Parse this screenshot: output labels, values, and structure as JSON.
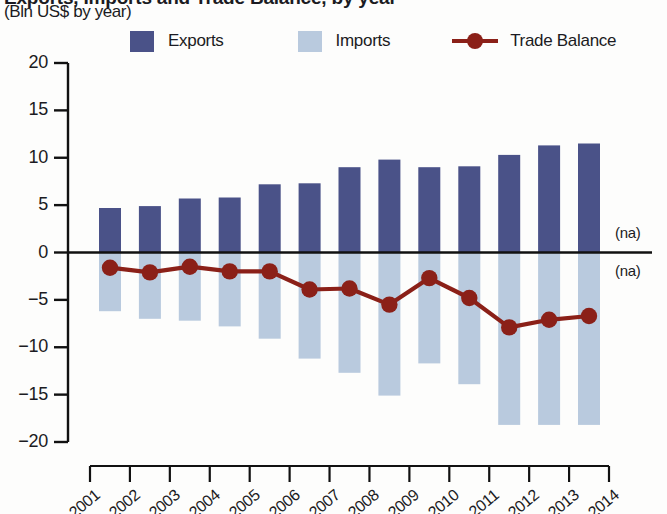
{
  "title": {
    "main": "Exports, Imports and Trade Balance, by year",
    "sub": "(Bln US$ by year)"
  },
  "legend": {
    "exports_label": "Exports",
    "imports_label": "Imports",
    "balance_label": "Trade Balance"
  },
  "colors": {
    "exports": "#4a5288",
    "imports": "#b9cade",
    "balance": "#8b2018",
    "axis": "#111111"
  },
  "annotations": {
    "na_upper": "(na)",
    "na_lower": "(na)"
  },
  "chart_data": {
    "type": "bar",
    "title": "Exports, Imports and Trade Balance, by year",
    "subtitle": "(Bln US$ by year)",
    "xlabel": "",
    "ylabel": "Bln US$ by year",
    "ylim": [
      -20,
      20
    ],
    "yticks": [
      20,
      15,
      10,
      5,
      0,
      -5,
      -10,
      -15,
      -20
    ],
    "ytick_labels": [
      "20",
      "15",
      "10",
      "5",
      "0",
      "-5",
      "-10",
      "-15",
      "-20"
    ],
    "grid": false,
    "legend_position": "top",
    "categories": [
      "2001",
      "2002",
      "2003",
      "2004",
      "2005",
      "2006",
      "2007",
      "2008",
      "2009",
      "2010",
      "2011",
      "2012",
      "2013"
    ],
    "xtick_labels": [
      "2001",
      "2002",
      "2003",
      "2004",
      "2005",
      "2006",
      "2007",
      "2008",
      "2009",
      "2010",
      "2011",
      "2012",
      "2013",
      "2014"
    ],
    "series": [
      {
        "name": "Exports",
        "type": "bar",
        "color": "#4a5288",
        "values": [
          4.7,
          4.9,
          5.7,
          5.8,
          7.2,
          7.3,
          9.0,
          9.8,
          9.0,
          9.1,
          10.3,
          11.3,
          11.5
        ]
      },
      {
        "name": "Imports",
        "type": "bar",
        "color": "#b9cade",
        "values": [
          -6.2,
          -7.0,
          -7.2,
          -7.8,
          -9.1,
          -11.2,
          -12.7,
          -15.1,
          -11.7,
          -13.9,
          -18.2,
          -18.2,
          -18.2
        ]
      },
      {
        "name": "Trade Balance",
        "type": "line",
        "color": "#8b2018",
        "values": [
          -1.6,
          -2.1,
          -1.5,
          -2.0,
          -2.0,
          -3.9,
          -3.8,
          -5.5,
          -2.7,
          -4.8,
          -7.9,
          -7.1,
          -6.7
        ]
      }
    ]
  }
}
